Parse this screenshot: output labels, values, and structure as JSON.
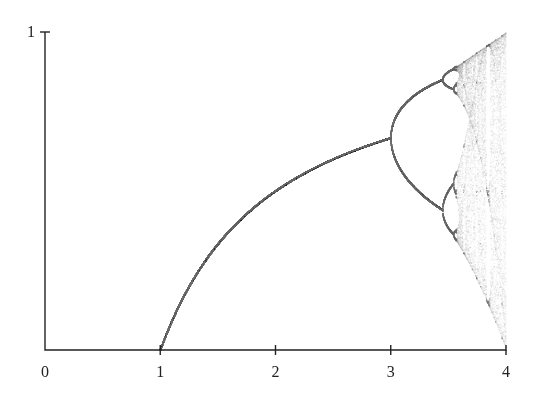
{
  "chart_data": {
    "type": "scatter",
    "title": "",
    "subtitle": "",
    "xlabel": "",
    "ylabel": "",
    "x_ticks": [
      0,
      1,
      2,
      3,
      4
    ],
    "x_tick_labels": [
      "0",
      "1",
      "2",
      "3",
      "4"
    ],
    "y_ticks": [
      1
    ],
    "y_tick_labels": [
      "1"
    ],
    "xlim": [
      0,
      4
    ],
    "ylim": [
      0,
      1
    ],
    "grid": false,
    "legend": null,
    "series": [
      {
        "name": "attractor",
        "r_start": 1.0,
        "r_end": 4.0,
        "function": "x_{n+1} = r * x_n * (1 - x_n)",
        "key_points": [
          {
            "r": 1.0,
            "x": 0.0
          },
          {
            "r": 2.0,
            "x": 0.5
          },
          {
            "r": 3.0,
            "x": 0.667
          },
          {
            "r": 3.449,
            "x": [
              0.44,
              0.85
            ]
          },
          {
            "r": 3.57,
            "x": "onset of chaos"
          },
          {
            "r": 4.0,
            "x": [
              0.0,
              1.0
            ]
          }
        ]
      }
    ],
    "colors": {
      "axis": "#222222",
      "curve": "#7a7a7a",
      "chaos": "#9a9a9a"
    }
  },
  "axes": {
    "origin_px": [
      45,
      350
    ],
    "x_unit_px": 115.25,
    "y_unit_px": 318
  }
}
